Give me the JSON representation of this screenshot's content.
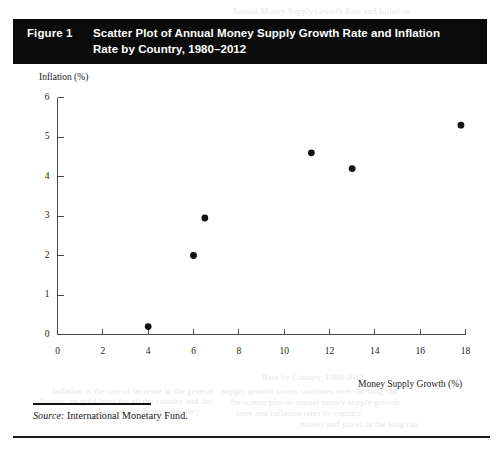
{
  "figure": {
    "number": "Figure 1",
    "title_line1": "Scatter Plot of Annual Money Supply Growth Rate and Inflation",
    "title_line2": "Rate by Country, 1980–2012"
  },
  "source": {
    "label": "Source:",
    "text": "International Monetary Fund."
  },
  "colors": {
    "header_bg": "#0b0b0b",
    "header_text": "#ffffff",
    "axis": "#4a4a4a",
    "point": "#111111",
    "rule": "#1a1a1a",
    "page_bg": "#ffffff"
  },
  "ghost_text": [
    {
      "text": "Annual Money Supply Growth Rate and Inflation",
      "x": 232,
      "y": 6
    },
    {
      "text": "Rate by Country, 1980-2012",
      "x": 262,
      "y": 372
    },
    {
      "text": "Inflation is the rate of increase in the general",
      "x": 52,
      "y": 386
    },
    {
      "text": "Source: an  gold   level for  all   the   country  and   the",
      "x": 40,
      "y": 396
    },
    {
      "text": "supply growth across countries over the long run",
      "x": 222,
      "y": 386
    },
    {
      "text": "the scatter plot of annual money supply growth",
      "x": 230,
      "y": 397
    },
    {
      "text": "rates and inflation rates by country",
      "x": 236,
      "y": 408
    },
    {
      "text": "money and prices in the long run",
      "x": 300,
      "y": 419
    },
    {
      "text": "the quantity theory of money",
      "x": 96,
      "y": 406
    }
  ],
  "chart_data": {
    "type": "scatter",
    "title": "Scatter Plot of Annual Money Supply Growth Rate and Inflation Rate by Country, 1980–2012",
    "xlabel": "Money Supply Growth (%)",
    "ylabel": "Inflation (%)",
    "xlim": [
      0,
      18
    ],
    "ylim": [
      0,
      6
    ],
    "xticks": [
      0,
      2,
      4,
      6,
      8,
      10,
      12,
      14,
      16,
      18
    ],
    "yticks": [
      0,
      1,
      2,
      3,
      4,
      5,
      6
    ],
    "grid": false,
    "legend": null,
    "series": [
      {
        "name": "Country observations",
        "marker": "filled-circle",
        "color": "#111111",
        "points": [
          {
            "x": 4.0,
            "y": 0.2
          },
          {
            "x": 6.0,
            "y": 2.0
          },
          {
            "x": 6.5,
            "y": 2.95
          },
          {
            "x": 11.2,
            "y": 4.6
          },
          {
            "x": 13.0,
            "y": 4.2
          },
          {
            "x": 17.8,
            "y": 5.3
          }
        ]
      }
    ]
  }
}
